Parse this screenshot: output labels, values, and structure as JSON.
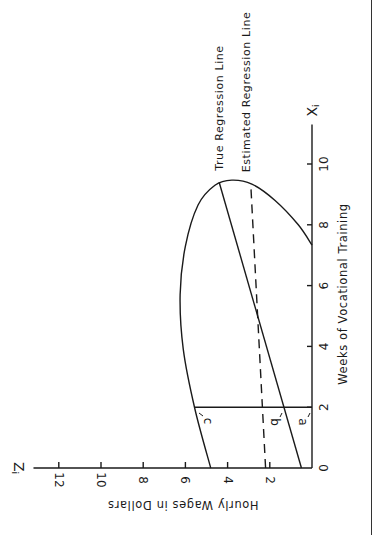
{
  "chart_data": {
    "type": "line",
    "title": "",
    "orientation": "rotated 90deg: X axis runs vertically upward on the right, Z axis runs horizontally leftward along the bottom",
    "xlabel": "Weeks of Vocational Training",
    "ylabel": "Hourly Wages in Dollars",
    "x_axis_symbol": "X",
    "x_axis_symbol_sub": "i",
    "y_axis_symbol": "Z",
    "y_axis_symbol_sub": "i",
    "x_ticks": [
      0,
      2,
      4,
      6,
      8,
      10
    ],
    "y_ticks": [
      2,
      4,
      6,
      8,
      10,
      12
    ],
    "origin_label": "0",
    "xlim": [
      0,
      11.3
    ],
    "ylim": [
      0,
      13.2
    ],
    "grid": false,
    "series": [
      {
        "name": "True Regression Line",
        "style": "solid",
        "x": [
          0,
          9.4
        ],
        "y": [
          0.5,
          4.4
        ]
      },
      {
        "name": "Estimated Regression Line",
        "style": "dashed",
        "x": [
          0,
          9.3
        ],
        "y": [
          2.2,
          2.9
        ]
      },
      {
        "name": "Data ellipse",
        "style": "solid",
        "x": [
          0,
          1.94,
          3.9,
          5.7,
          7.3,
          8.65,
          9.3,
          9.47,
          9.34,
          8.8,
          8.0,
          7.33
        ],
        "y": [
          4.8,
          5.55,
          6.1,
          6.25,
          6.0,
          5.4,
          4.6,
          3.8,
          2.85,
          1.75,
          0.65,
          0
        ]
      }
    ],
    "annotations": [
      {
        "text": "True Regression Line",
        "at": "top end of solid line"
      },
      {
        "text": "Estimated Regression Line",
        "at": "top end of dashed line"
      },
      {
        "text": "a",
        "x": 2,
        "note": "distance from axis to true regression line at X=2"
      },
      {
        "text": "b",
        "x": 2,
        "note": "point on estimated regression line at X=2"
      },
      {
        "text": "c",
        "x": 2,
        "note": "edge of ellipse at X=2"
      }
    ],
    "reference_line": {
      "x": 2,
      "from_y": 0,
      "to_y": 5.55
    }
  },
  "labels": {
    "true_line": "True Regression Line",
    "estimated_line": "Estimated Regression Line",
    "x_axis_title": "Weeks of Vocational Training",
    "y_axis_title": "Hourly Wages in Dollars",
    "a": "a",
    "b": "b",
    "c": "c"
  },
  "layout": {
    "origin_px": [
      312,
      468
    ],
    "px_per_week": 30.4,
    "px_per_dollar": 21.1,
    "ink": "#1a1a1a"
  }
}
